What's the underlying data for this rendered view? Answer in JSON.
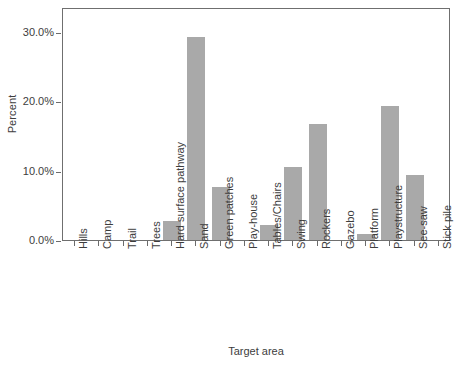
{
  "chart_data": {
    "type": "bar",
    "title": "",
    "xlabel": "Target area",
    "ylabel": "Percent",
    "categories": [
      "Hills",
      "Camp",
      "Trail",
      "Trees",
      "Hard surface pathway",
      "Sand",
      "Green patches",
      "Play-house",
      "Tables/Chairs",
      "Swing",
      "Rockers",
      "Gazebo",
      "Platform",
      "Playstructure",
      "See-saw",
      "Stick pile"
    ],
    "values": [
      0.0,
      0.0,
      0.0,
      0.0,
      2.8,
      29.3,
      7.7,
      0.0,
      2.2,
      10.6,
      16.8,
      0.0,
      0.8,
      19.3,
      9.4,
      0.0
    ],
    "ytick_labels": [
      "0.0%",
      "10.0%",
      "20.0%",
      "30.0%"
    ],
    "ytick_values": [
      0,
      10,
      20,
      30
    ],
    "ylim": [
      0,
      33.6
    ],
    "grid": false,
    "legend": false,
    "bar_color": "#a9a9a9",
    "axis_color": "#6f6f6f",
    "text_color": "#3d3d3d"
  }
}
